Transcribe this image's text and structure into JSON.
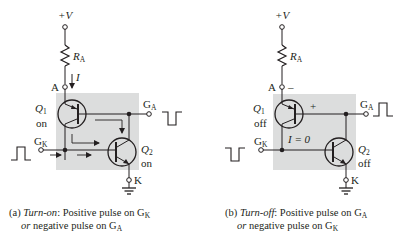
{
  "figure": {
    "panels": [
      {
        "id": "a",
        "supply_label": "+V",
        "resistor_label": "R",
        "resistor_sub": "A",
        "anode_label": "A",
        "current_label": "I",
        "q1_label": "Q",
        "q1_sub": "1",
        "q1_state": "on",
        "q2_label": "Q",
        "q2_sub": "2",
        "q2_state": "on",
        "ga_label": "G",
        "ga_sub": "A",
        "gk_label": "G",
        "gk_sub": "K",
        "cathode_label": "K",
        "ga_pulse": "negative",
        "gk_pulse": "positive",
        "caption": {
          "prefix": "(a) ",
          "title": "Turn-on",
          "line1_rest": ": Positive pulse on G",
          "line1_sub": "K",
          "line2_or": "or",
          "line2_rest": " negative pulse on G",
          "line2_sub": "A"
        }
      },
      {
        "id": "b",
        "supply_label": "+V",
        "resistor_label": "R",
        "resistor_sub": "A",
        "anode_label": "A",
        "anode_polarity": "–",
        "gate_polarity": "+",
        "current_label": "I = 0",
        "q1_label": "Q",
        "q1_sub": "1",
        "q1_state": "off",
        "q2_label": "Q",
        "q2_sub": "2",
        "q2_state": "off",
        "ga_label": "G",
        "ga_sub": "A",
        "gk_label": "G",
        "gk_sub": "K",
        "cathode_label": "K",
        "ga_pulse": "positive",
        "gk_pulse": "negative",
        "caption": {
          "prefix": "(b) ",
          "title": "Turn-off",
          "line1_rest": ": Positive pulse on G",
          "line1_sub": "A",
          "line2_or": "or",
          "line2_rest": " negative pulse on G",
          "line2_sub": "K"
        }
      }
    ],
    "colors": {
      "shade": "#dcdddd",
      "line": "#231f20",
      "background": "#ffffff"
    }
  }
}
